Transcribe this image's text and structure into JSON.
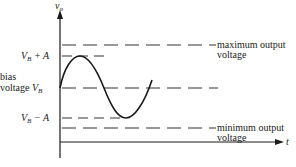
{
  "axes": {
    "y_label": "v",
    "y_label_sub": "o",
    "x_label": "t"
  },
  "levels": {
    "max_output": {
      "line1": "maximum output",
      "line2": "voltage"
    },
    "vb_plus_a": {
      "main": "V",
      "sub": "B",
      "rest": " + A"
    },
    "bias": {
      "line1": "bias",
      "line2": "voltage ",
      "main": "V",
      "sub": "B"
    },
    "vb_minus_a": {
      "main": "V",
      "sub": "B",
      "rest": " − A"
    },
    "min_output": {
      "line1": "minimum output",
      "line2": "voltage"
    }
  },
  "colors": {
    "ink": "#1a1a1a",
    "dash": "#333333"
  }
}
